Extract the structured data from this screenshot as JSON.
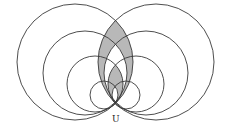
{
  "diagram": {
    "type": "tangent circles at a common point",
    "point_label": "U",
    "point": {
      "x": 115,
      "y": 104
    },
    "stroke_color": "#3a3a3a",
    "shade_color": "#b8b8b8",
    "left_circles": [
      {
        "cx": 75,
        "cy": 62,
        "r": 58
      },
      {
        "cx": 85,
        "cy": 73,
        "r": 42
      },
      {
        "cx": 95,
        "cy": 84,
        "r": 28
      },
      {
        "cx": 104,
        "cy": 95,
        "r": 14
      }
    ],
    "right_circles": [
      {
        "cx": 156,
        "cy": 62,
        "r": 58
      },
      {
        "cx": 146,
        "cy": 73,
        "r": 42
      },
      {
        "cx": 136,
        "cy": 84,
        "r": 28
      },
      {
        "cx": 126,
        "cy": 95,
        "r": 14
      }
    ]
  }
}
